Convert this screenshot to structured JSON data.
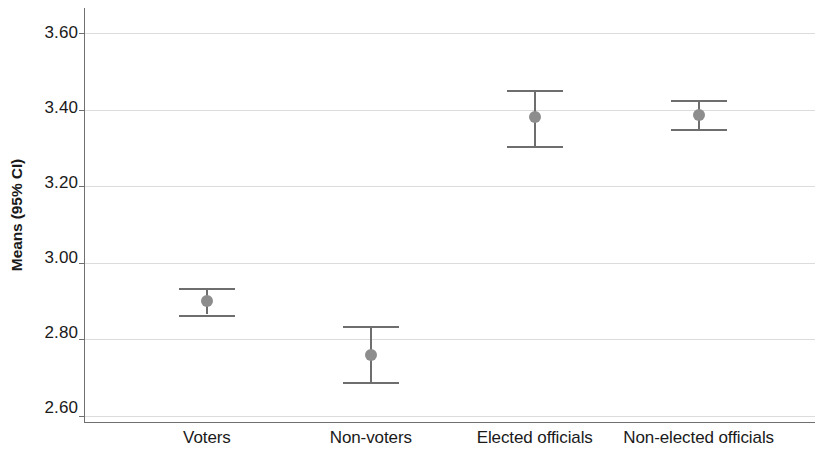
{
  "chart_data": {
    "type": "scatter",
    "title": "",
    "subtitle": "",
    "xlabel": "",
    "ylabel": "Means (95% CI)",
    "categories": [
      "Voters",
      "Non-voters",
      "Elected officials",
      "Non-elected officials"
    ],
    "values": [
      2.9,
      2.76,
      3.38,
      3.385
    ],
    "ci_lower": [
      2.865,
      2.69,
      3.305,
      3.35
    ],
    "ci_upper": [
      2.935,
      2.835,
      3.45,
      3.425
    ],
    "series": [
      {
        "name": "Means (95% CI)",
        "points": [
          {
            "category": "Voters",
            "mean": 2.9,
            "ci_lower": 2.865,
            "ci_upper": 2.935
          },
          {
            "category": "Non-voters",
            "mean": 2.76,
            "ci_lower": 2.69,
            "ci_upper": 2.835
          },
          {
            "category": "Elected officials",
            "mean": 3.38,
            "ci_lower": 3.305,
            "ci_upper": 3.45
          },
          {
            "category": "Non-elected officials",
            "mean": 3.385,
            "ci_lower": 3.35,
            "ci_upper": 3.425
          }
        ]
      }
    ],
    "ylim": [
      2.6,
      3.6
    ],
    "yticks": [
      2.6,
      2.8,
      3.0,
      3.2,
      3.4,
      3.6
    ],
    "ytick_labels": [
      "2.60",
      "2.80",
      "3.00",
      "3.20",
      "3.40",
      "3.60"
    ],
    "grid": true,
    "grid_axis": "y",
    "legend": false,
    "legend_position": "none",
    "error_bar_color": "#6e6e6e",
    "marker_color": "#8d8d8d",
    "gridline_color": "#dcdcdc",
    "axis_color": "#707070",
    "text_color": "#1a1a1a",
    "background": "#ffffff"
  }
}
